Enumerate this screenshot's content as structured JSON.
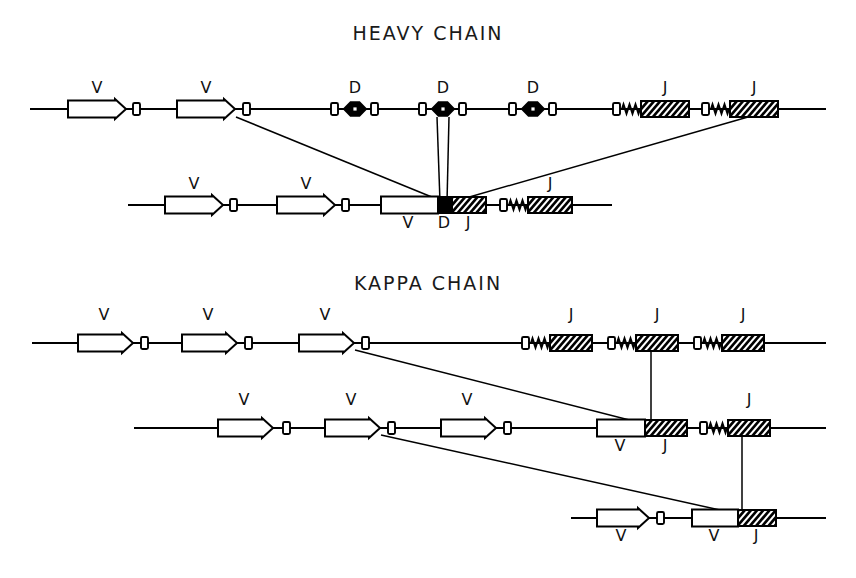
{
  "figure": {
    "kind": "vdj-recombination-diagram",
    "background": "#ffffff",
    "ink": "#000000",
    "width": 856,
    "height": 578
  },
  "titles": {
    "heavy": "HEAVY CHAIN",
    "kappa": "KAPPA CHAIN"
  },
  "legend_glyphs": {
    "v_segment": "white-arrow-box",
    "d_segment": "black-bowtie",
    "j_segment": "black-hatched-box",
    "rss": "white-signal-box",
    "spring": "zigzag-spacer"
  },
  "labels": {
    "v": "V",
    "d": "D",
    "j": "J"
  },
  "chart_data": {
    "type": "diagram",
    "panels": [
      {
        "name": "heavy-chain",
        "title": "HEAVY CHAIN",
        "rows": [
          {
            "name": "heavy-germline",
            "y": 109,
            "x0": 30,
            "x1": 826,
            "segments": [
              {
                "type": "V",
                "label": "V",
                "x": 68,
                "w": 58,
                "label_x": 97,
                "label_y": 93
              },
              {
                "type": "RSS",
                "x": 133,
                "w": 7
              },
              {
                "type": "V",
                "label": "V",
                "x": 177,
                "w": 58,
                "label_x": 206,
                "label_y": 93
              },
              {
                "type": "RSS",
                "x": 243,
                "w": 7
              },
              {
                "type": "RSS",
                "x": 331,
                "w": 7
              },
              {
                "type": "D",
                "label": "D",
                "x": 344,
                "w": 22,
                "label_x": 355,
                "label_y": 93
              },
              {
                "type": "RSS",
                "x": 371,
                "w": 7
              },
              {
                "type": "RSS",
                "x": 419,
                "w": 7
              },
              {
                "type": "D",
                "label": "D",
                "x": 432,
                "w": 22,
                "label_x": 443,
                "label_y": 93
              },
              {
                "type": "RSS",
                "x": 459,
                "w": 7
              },
              {
                "type": "RSS",
                "x": 509,
                "w": 7
              },
              {
                "type": "D",
                "label": "D",
                "x": 522,
                "w": 22,
                "label_x": 533,
                "label_y": 93
              },
              {
                "type": "RSS",
                "x": 549,
                "w": 7
              },
              {
                "type": "RSS",
                "x": 613,
                "w": 7
              },
              {
                "type": "SPRING",
                "x": 622,
                "w": 18
              },
              {
                "type": "J",
                "label": "J",
                "x": 641,
                "w": 48,
                "label_x": 665,
                "label_y": 93
              },
              {
                "type": "RSS",
                "x": 702,
                "w": 7
              },
              {
                "type": "SPRING",
                "x": 711,
                "w": 18
              },
              {
                "type": "J",
                "label": "J",
                "x": 730,
                "w": 48,
                "label_x": 754,
                "label_y": 93
              }
            ]
          },
          {
            "name": "heavy-rearranged",
            "y": 205,
            "x0": 128,
            "x1": 612,
            "segments": [
              {
                "type": "V",
                "label": "V",
                "x": 165,
                "w": 58,
                "label_x": 194,
                "label_y": 189
              },
              {
                "type": "RSS",
                "x": 230,
                "w": 7
              },
              {
                "type": "V",
                "label": "V",
                "x": 277,
                "w": 58,
                "label_x": 306,
                "label_y": 189
              },
              {
                "type": "RSS",
                "x": 342,
                "w": 7
              },
              {
                "type": "VDJ",
                "label": "V D J",
                "x": 381,
                "w": 100,
                "parts": [
                  {
                    "type": "V",
                    "x": 381,
                    "w": 57,
                    "label": "V",
                    "label_x": 408,
                    "label_y": 228
                  },
                  {
                    "type": "D",
                    "x": 438,
                    "w": 14,
                    "label": "D",
                    "label_x": 444,
                    "label_y": 228
                  },
                  {
                    "type": "J",
                    "x": 452,
                    "w": 34,
                    "label": "J",
                    "label_x": 468,
                    "label_y": 228
                  }
                ]
              },
              {
                "type": "RSS",
                "x": 500,
                "w": 7
              },
              {
                "type": "SPRING",
                "x": 509,
                "w": 18
              },
              {
                "type": "J",
                "label": "J",
                "x": 528,
                "w": 44,
                "label_x": 550,
                "label_y": 189
              }
            ]
          }
        ],
        "connectors": [
          {
            "kind": "line",
            "from": [
              236,
              117
            ],
            "to": [
              444,
              202
            ],
            "note": "V2-tip to VDJ junction"
          },
          {
            "kind": "line",
            "from": [
              437,
              117
            ],
            "to": [
              440,
              202
            ],
            "note": "D2 left down to VDJ"
          },
          {
            "kind": "line",
            "from": [
              449,
              117
            ],
            "to": [
              447,
              202
            ],
            "note": "D2 right down to VDJ"
          },
          {
            "kind": "line",
            "from": [
              748,
              117
            ],
            "to": [
              452,
              202
            ],
            "note": "J2 to VDJ junction"
          }
        ]
      },
      {
        "name": "kappa-chain",
        "title": "KAPPA CHAIN",
        "rows": [
          {
            "name": "kappa-germline",
            "y": 343,
            "x0": 32,
            "x1": 826,
            "segments": [
              {
                "type": "V",
                "label": "V",
                "x": 78,
                "w": 55,
                "label_x": 104,
                "label_y": 320
              },
              {
                "type": "RSS",
                "x": 141,
                "w": 7
              },
              {
                "type": "V",
                "label": "V",
                "x": 182,
                "w": 55,
                "label_x": 208,
                "label_y": 320
              },
              {
                "type": "RSS",
                "x": 245,
                "w": 7
              },
              {
                "type": "V",
                "label": "V",
                "x": 299,
                "w": 55,
                "label_x": 325,
                "label_y": 320
              },
              {
                "type": "RSS",
                "x": 362,
                "w": 7
              },
              {
                "type": "RSS",
                "x": 522,
                "w": 7
              },
              {
                "type": "SPRING",
                "x": 531,
                "w": 18
              },
              {
                "type": "J",
                "label": "J",
                "x": 550,
                "w": 42,
                "label_x": 571,
                "label_y": 320
              },
              {
                "type": "RSS",
                "x": 608,
                "w": 7
              },
              {
                "type": "SPRING",
                "x": 617,
                "w": 18
              },
              {
                "type": "J",
                "label": "J",
                "x": 636,
                "w": 42,
                "label_x": 657,
                "label_y": 320
              },
              {
                "type": "RSS",
                "x": 694,
                "w": 7
              },
              {
                "type": "SPRING",
                "x": 703,
                "w": 18
              },
              {
                "type": "J",
                "label": "J",
                "x": 722,
                "w": 42,
                "label_x": 743,
                "label_y": 320
              }
            ]
          },
          {
            "name": "kappa-rearranged-1",
            "y": 428,
            "x0": 134,
            "x1": 826,
            "segments": [
              {
                "type": "V",
                "label": "V",
                "x": 218,
                "w": 55,
                "label_x": 244,
                "label_y": 405
              },
              {
                "type": "RSS",
                "x": 283,
                "w": 7
              },
              {
                "type": "V",
                "label": "V",
                "x": 325,
                "w": 55,
                "label_x": 351,
                "label_y": 405
              },
              {
                "type": "RSS",
                "x": 388,
                "w": 7
              },
              {
                "type": "V",
                "label": "V",
                "x": 441,
                "w": 55,
                "label_x": 467,
                "label_y": 405
              },
              {
                "type": "RSS",
                "x": 504,
                "w": 7
              },
              {
                "type": "VJ",
                "label": "V J",
                "x": 597,
                "w": 90,
                "parts": [
                  {
                    "type": "V",
                    "x": 597,
                    "w": 48,
                    "label": "V",
                    "label_x": 620,
                    "label_y": 451
                  },
                  {
                    "type": "J",
                    "x": 645,
                    "w": 42,
                    "label": "J",
                    "label_x": 665,
                    "label_y": 451
                  }
                ]
              },
              {
                "type": "RSS",
                "x": 700,
                "w": 7
              },
              {
                "type": "SPRING",
                "x": 709,
                "w": 18
              },
              {
                "type": "J",
                "label": "J",
                "x": 728,
                "w": 42,
                "label_x": 749,
                "label_y": 405
              }
            ]
          },
          {
            "name": "kappa-rearranged-2",
            "y": 518,
            "x0": 571,
            "x1": 826,
            "segments": [
              {
                "type": "V",
                "label": "V",
                "x": 597,
                "w": 52,
                "label_x": 621,
                "label_y": 541
              },
              {
                "type": "RSS",
                "x": 657,
                "w": 7
              },
              {
                "type": "VJ",
                "label": "V J",
                "x": 692,
                "w": 84,
                "parts": [
                  {
                    "type": "V",
                    "x": 692,
                    "w": 46,
                    "label": "V",
                    "label_x": 714,
                    "label_y": 541
                  },
                  {
                    "type": "J",
                    "x": 738,
                    "w": 38,
                    "label": "J",
                    "label_x": 756,
                    "label_y": 541
                  }
                ]
              }
            ]
          }
        ],
        "connectors": [
          {
            "kind": "line",
            "from": [
              355,
              350
            ],
            "to": [
              645,
              424
            ],
            "note": "kappa V3 tip to VJ"
          },
          {
            "kind": "line",
            "from": [
              651,
              351
            ],
            "to": [
              651,
              421
            ],
            "note": "germline J2 down to VJ"
          },
          {
            "kind": "line",
            "from": [
              381,
              435
            ],
            "to": [
              738,
              514
            ],
            "note": "kappa V2 tip to VJ row3"
          },
          {
            "kind": "line",
            "from": [
              742,
              436
            ],
            "to": [
              742,
              511
            ],
            "note": "row2 J down to row3 VJ"
          }
        ]
      }
    ]
  }
}
